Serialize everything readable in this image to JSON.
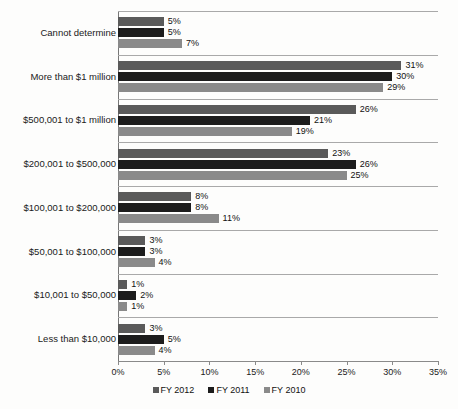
{
  "chart_data": {
    "type": "bar",
    "orientation": "horizontal",
    "title": "",
    "subtitle": "",
    "xlabel": "",
    "ylabel": "",
    "xlim": [
      0,
      35
    ],
    "xticks": [
      "0%",
      "5%",
      "10%",
      "15%",
      "20%",
      "25%",
      "30%",
      "35%"
    ],
    "xtick_values": [
      0,
      5,
      10,
      15,
      20,
      25,
      30,
      35
    ],
    "grid": false,
    "legend_position": "bottom",
    "value_label_suffix": "%",
    "categories": [
      "Cannot determine",
      "More than $1 million",
      "$500,001 to $1 million",
      "$200,001 to $500,000",
      "$100,001 to $200,000",
      "$50,001 to $100,000",
      "$10,001 to $50,000",
      "Less than $10,000"
    ],
    "series": [
      {
        "name": "FY 2012",
        "color": "#5a5a5a",
        "values": [
          5,
          31,
          26,
          23,
          8,
          3,
          1,
          3
        ],
        "labels": [
          "5%",
          "31%",
          "26%",
          "23%",
          "8%",
          "3%",
          "1%",
          "3%"
        ]
      },
      {
        "name": "FY 2011",
        "color": "#1c1c1c",
        "values": [
          5,
          30,
          21,
          26,
          8,
          3,
          2,
          5
        ],
        "labels": [
          "5%",
          "30%",
          "21%",
          "26%",
          "8%",
          "3%",
          "2%",
          "5%"
        ]
      },
      {
        "name": "FY 2010",
        "color": "#8a8a8a",
        "values": [
          7,
          29,
          19,
          25,
          11,
          4,
          1,
          4
        ],
        "labels": [
          "7%",
          "29%",
          "19%",
          "25%",
          "11%",
          "4%",
          "1%",
          "4%"
        ]
      }
    ]
  },
  "legend": {
    "items": [
      {
        "label": "FY 2012",
        "swatch": "legend-swatch-fy-2012"
      },
      {
        "label": "FY 2011",
        "swatch": "legend-swatch-fy-2011"
      },
      {
        "label": "FY 2010",
        "swatch": "legend-swatch-fy-2010"
      }
    ]
  }
}
